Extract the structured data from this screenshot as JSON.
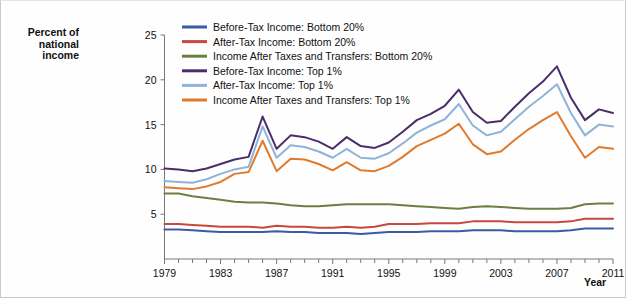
{
  "chart_data": {
    "type": "line",
    "title": "",
    "xlabel": "Year",
    "ylabel": "Percent of national income",
    "xlim": [
      1979,
      2011
    ],
    "ylim": [
      0,
      25
    ],
    "yticks": [
      5,
      10,
      15,
      20,
      25
    ],
    "xticks": [
      1979,
      1983,
      1987,
      1991,
      1995,
      1999,
      2003,
      2007,
      2011
    ],
    "grid": false,
    "legend_position": "top-center",
    "x": [
      1979,
      1980,
      1981,
      1982,
      1983,
      1984,
      1985,
      1986,
      1987,
      1988,
      1989,
      1990,
      1991,
      1992,
      1993,
      1994,
      1995,
      1996,
      1997,
      1998,
      1999,
      2000,
      2001,
      2002,
      2003,
      2004,
      2005,
      2006,
      2007,
      2008,
      2009,
      2010,
      2011
    ],
    "series": [
      {
        "name": "Before-Tax Income: Bottom 20%",
        "color": "#3b5ba5",
        "values": [
          3.3,
          3.3,
          3.2,
          3.1,
          3.0,
          3.0,
          3.0,
          3.0,
          3.1,
          3.0,
          3.0,
          2.9,
          2.9,
          2.9,
          2.8,
          2.9,
          3.0,
          3.0,
          3.0,
          3.1,
          3.1,
          3.1,
          3.2,
          3.2,
          3.2,
          3.1,
          3.1,
          3.1,
          3.1,
          3.2,
          3.4,
          3.4,
          3.4
        ]
      },
      {
        "name": "After-Tax Income: Bottom 20%",
        "color": "#c8473f",
        "values": [
          3.9,
          3.9,
          3.8,
          3.7,
          3.6,
          3.6,
          3.6,
          3.5,
          3.7,
          3.6,
          3.6,
          3.5,
          3.5,
          3.6,
          3.5,
          3.6,
          3.9,
          3.9,
          3.9,
          4.0,
          4.0,
          4.0,
          4.2,
          4.2,
          4.2,
          4.1,
          4.1,
          4.1,
          4.1,
          4.2,
          4.5,
          4.5,
          4.5
        ]
      },
      {
        "name": "Income After Taxes and Transfers: Bottom 20%",
        "color": "#6b8040",
        "values": [
          7.3,
          7.3,
          7.0,
          6.8,
          6.6,
          6.4,
          6.3,
          6.3,
          6.2,
          6.0,
          5.9,
          5.9,
          6.0,
          6.1,
          6.1,
          6.1,
          6.1,
          6.0,
          5.9,
          5.8,
          5.7,
          5.6,
          5.8,
          5.9,
          5.8,
          5.7,
          5.6,
          5.6,
          5.6,
          5.7,
          6.1,
          6.2,
          6.2
        ]
      },
      {
        "name": "Before-Tax Income: Top 1%",
        "color": "#4a2d6b",
        "values": [
          10.1,
          10.0,
          9.8,
          10.1,
          10.6,
          11.1,
          11.4,
          15.9,
          12.3,
          13.8,
          13.6,
          13.1,
          12.3,
          13.6,
          12.6,
          12.4,
          13.0,
          14.2,
          15.5,
          16.2,
          17.1,
          18.9,
          16.4,
          15.2,
          15.4,
          17.0,
          18.5,
          19.8,
          21.5,
          18.0,
          15.5,
          16.7,
          16.3
        ]
      },
      {
        "name": "After-Tax Income: Top 1%",
        "color": "#8fb4d9",
        "values": [
          8.7,
          8.6,
          8.5,
          8.9,
          9.5,
          10.0,
          10.3,
          14.8,
          11.3,
          12.7,
          12.5,
          12.0,
          11.3,
          12.3,
          11.3,
          11.2,
          11.8,
          12.9,
          14.1,
          14.9,
          15.6,
          17.3,
          14.9,
          13.8,
          14.2,
          15.6,
          17.0,
          18.2,
          19.5,
          16.3,
          13.8,
          15.0,
          14.8
        ]
      },
      {
        "name": "Income After Taxes and Transfers: Top 1%",
        "color": "#e07b2e",
        "values": [
          8.0,
          7.9,
          7.8,
          8.1,
          8.6,
          9.5,
          9.7,
          13.2,
          9.8,
          11.2,
          11.1,
          10.6,
          9.9,
          10.8,
          9.9,
          9.8,
          10.4,
          11.4,
          12.6,
          13.3,
          14.0,
          15.1,
          12.8,
          11.7,
          12.0,
          13.3,
          14.5,
          15.5,
          16.4,
          13.7,
          11.3,
          12.5,
          12.3
        ]
      }
    ]
  },
  "legend": {
    "items": [
      {
        "label": "Before-Tax Income: Bottom 20%"
      },
      {
        "label": "After-Tax Income: Bottom 20%"
      },
      {
        "label": "Income After Taxes and Transfers: Bottom 20%"
      },
      {
        "label": "Before-Tax Income: Top 1%"
      },
      {
        "label": "After-Tax Income: Top 1%"
      },
      {
        "label": "Income After Taxes and Transfers: Top 1%"
      }
    ]
  },
  "axis": {
    "y_title_line1": "Percent of",
    "y_title_line2": "national",
    "y_title_line3": "income",
    "x_title": "Year"
  }
}
